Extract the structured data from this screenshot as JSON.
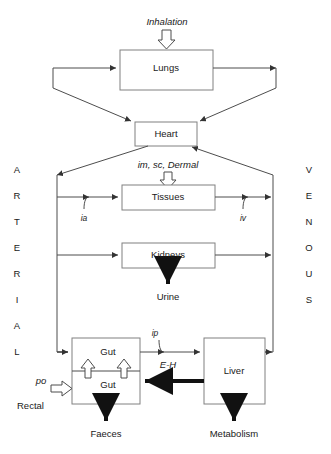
{
  "figure": {
    "type": "physiological-flow-diagram"
  },
  "nodes": {
    "lungs": "Lungs",
    "heart": "Heart",
    "tissues": "Tissues",
    "kidneys": "Kidneys",
    "gut_upper": "Gut",
    "gut_lower": "Gut",
    "liver": "Liver"
  },
  "route_labels": {
    "inhalation": "Inhalation",
    "im_sc_dermal": "im, sc, Dermal",
    "ia": "ia",
    "iv": "iv",
    "ip": "ip",
    "po": "po",
    "rectal": "Rectal",
    "eh": "E-H"
  },
  "outputs": {
    "urine": "Urine",
    "faeces": "Faeces",
    "metabolism": "Metabolism"
  },
  "circulation": {
    "arterial": [
      "A",
      "R",
      "T",
      "E",
      "R",
      "I",
      "A",
      "L"
    ],
    "venous": [
      "V",
      "E",
      "N",
      "O",
      "U",
      "S"
    ]
  },
  "colors": {
    "box_stroke": "#808080",
    "line": "#4d4d4d",
    "thick_line": "#111111",
    "text": "#1a1a1a",
    "background": "#ffffff"
  }
}
